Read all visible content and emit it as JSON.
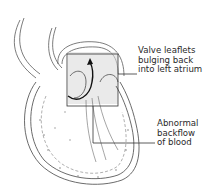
{
  "diagram": {
    "labels": [
      {
        "lines": [
          "Valve leaflets",
          "bulging back",
          "into left atrium"
        ]
      },
      {
        "lines": [
          "Abnormal",
          "backflow",
          "of blood"
        ]
      }
    ],
    "colors": {
      "ink": "#3a3a3a",
      "label_text": "#2a2a2a",
      "arrow": "#111111",
      "shading": "#bdbdbd"
    }
  }
}
